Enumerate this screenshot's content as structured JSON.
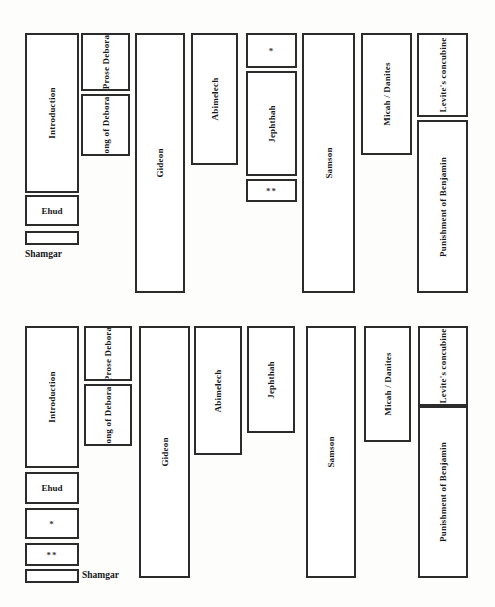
{
  "figure": {
    "type": "diagram",
    "panels": [
      {
        "id": "upper",
        "name": "upper-diagram",
        "captions": [
          {
            "name": "caption-shamgar",
            "text": "Shamgar"
          }
        ],
        "blocks": [
          {
            "name": "block-introduction",
            "label": "Introduction",
            "orientation": "vertical",
            "lines": 1
          },
          {
            "name": "block-ehud",
            "label": "Ehud",
            "orientation": "horizontal",
            "lines": 1
          },
          {
            "name": "block-shamgar",
            "label": "",
            "orientation": "none",
            "lines": 0
          },
          {
            "name": "block-prose-debora",
            "label": "Prose Debora",
            "orientation": "vertical",
            "lines": 2
          },
          {
            "name": "block-song-of-deborah",
            "label": "Song of Deborah",
            "orientation": "vertical",
            "lines": 2
          },
          {
            "name": "block-gideon",
            "label": "Gideon",
            "orientation": "vertical",
            "lines": 1
          },
          {
            "name": "block-abimelech",
            "label": "Abimelech",
            "orientation": "vertical",
            "lines": 1
          },
          {
            "name": "block-asterisk-single",
            "label": "*",
            "orientation": "symbol",
            "lines": 1
          },
          {
            "name": "block-jephthah",
            "label": "Jephthah",
            "orientation": "vertical",
            "lines": 1
          },
          {
            "name": "block-asterisk-double",
            "label": "**",
            "orientation": "symbol",
            "lines": 1
          },
          {
            "name": "block-samson",
            "label": "Samson",
            "orientation": "vertical",
            "lines": 1
          },
          {
            "name": "block-micah-danites",
            "label": "Micah / Danites",
            "orientation": "vertical",
            "lines": 1
          },
          {
            "name": "block-levites-concubine",
            "label": "Levite's concubine",
            "orientation": "vertical",
            "lines": 2
          },
          {
            "name": "block-punishment-benjamin",
            "label": "Punishment of Benjamin",
            "orientation": "vertical",
            "lines": 2
          }
        ]
      },
      {
        "id": "lower",
        "name": "lower-diagram",
        "captions": [
          {
            "name": "caption-shamgar",
            "text": "Shamgar"
          }
        ],
        "blocks": [
          {
            "name": "block-introduction",
            "label": "Introduction",
            "orientation": "vertical",
            "lines": 1
          },
          {
            "name": "block-ehud",
            "label": "Ehud",
            "orientation": "horizontal",
            "lines": 1
          },
          {
            "name": "block-asterisk-single",
            "label": "*",
            "orientation": "symbol",
            "lines": 1
          },
          {
            "name": "block-asterisk-double",
            "label": "**",
            "orientation": "symbol",
            "lines": 1
          },
          {
            "name": "block-shamgar",
            "label": "",
            "orientation": "none",
            "lines": 0
          },
          {
            "name": "block-prose-debora",
            "label": "Prose Debora",
            "orientation": "vertical",
            "lines": 2
          },
          {
            "name": "block-song-of-deborah",
            "label": "Song of Deborah",
            "orientation": "vertical",
            "lines": 2
          },
          {
            "name": "block-gideon",
            "label": "Gideon",
            "orientation": "vertical",
            "lines": 1
          },
          {
            "name": "block-abimelech",
            "label": "Abimelech",
            "orientation": "vertical",
            "lines": 1
          },
          {
            "name": "block-jephthah",
            "label": "Jephthah",
            "orientation": "vertical",
            "lines": 1
          },
          {
            "name": "block-samson",
            "label": "Samson",
            "orientation": "vertical",
            "lines": 1
          },
          {
            "name": "block-micah-danites",
            "label": "Micah / Danites",
            "orientation": "vertical",
            "lines": 1
          },
          {
            "name": "block-levites-concubine",
            "label": "Levite's concubine",
            "orientation": "vertical",
            "lines": 2
          },
          {
            "name": "block-punishment-benjamin",
            "label": "Punishment of Benjamin",
            "orientation": "vertical",
            "lines": 2
          }
        ]
      }
    ],
    "colors": {
      "stroke": "#2b2b2b",
      "fill": "#ffffff",
      "text": "#17171a",
      "background": "#fdfdfc"
    }
  }
}
